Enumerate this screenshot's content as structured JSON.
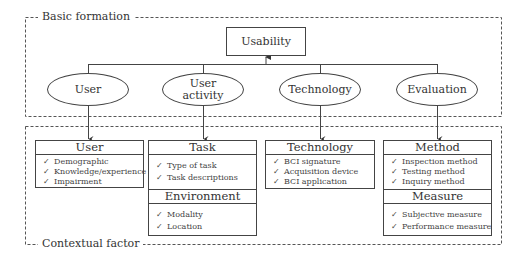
{
  "regions": {
    "basic": {
      "label": "Basic formation"
    },
    "contextual": {
      "label": "Contextual factor"
    }
  },
  "root": {
    "label": "Usability"
  },
  "ellipses": [
    {
      "label": "User"
    },
    {
      "label": "User activity"
    },
    {
      "label": "Technology"
    },
    {
      "label": "Evaluation"
    }
  ],
  "boxes": {
    "user": {
      "title": "User",
      "items": [
        "Demographic",
        "Knowledge/experience",
        "Impairment"
      ]
    },
    "task": {
      "title": "Task",
      "items": [
        "Type of task",
        "Task descriptions"
      ]
    },
    "environment": {
      "title": "Environment",
      "items": [
        "Modality",
        "Location"
      ]
    },
    "technology": {
      "title": "Technology",
      "items": [
        "BCI signature",
        "Acquisition device",
        "BCI application"
      ]
    },
    "method": {
      "title": "Method",
      "items": [
        "Inspection method",
        "Testing method",
        "Inquiry method"
      ]
    },
    "measure": {
      "title": "Measure",
      "items": [
        "Subjective measure",
        "Performance measure"
      ]
    }
  },
  "check_glyph": "✓"
}
